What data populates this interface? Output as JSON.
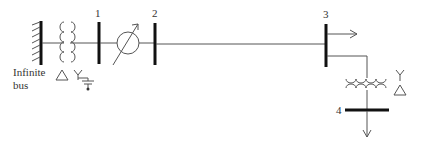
{
  "diagram": {
    "type": "one-line power system diagram",
    "buses": [
      {
        "id": "1",
        "label": "1"
      },
      {
        "id": "2",
        "label": "2"
      },
      {
        "id": "3",
        "label": "3"
      },
      {
        "id": "4",
        "label": "4"
      }
    ],
    "infinite_bus": {
      "label_line1": "Infinite",
      "label_line2": "bus"
    },
    "transformer_1": {
      "primary": "Δ",
      "secondary": "Y",
      "secondary_grounded": true
    },
    "transformer_2": {
      "primary": "Y",
      "secondary": "Δ"
    },
    "phase_shifter": {
      "between": [
        "1",
        "2"
      ]
    },
    "loads": [
      {
        "bus": "3",
        "direction": "right"
      },
      {
        "bus": "4",
        "direction": "down"
      }
    ]
  },
  "colors": {
    "line": "#555555",
    "bus": "#111111",
    "text": "#333333"
  }
}
